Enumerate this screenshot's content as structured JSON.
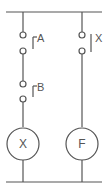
{
  "diagram": {
    "type": "ladder-logic-relay-circuit",
    "top_cutoff_text": "",
    "rungs": [
      {
        "contacts": [
          {
            "label": "A",
            "type": "normally-open"
          },
          {
            "label": "B",
            "type": "normally-open"
          }
        ],
        "coil": {
          "label": "X"
        }
      },
      {
        "contacts": [
          {
            "label": "X",
            "type": "normally-closed"
          }
        ],
        "coil": {
          "label": "F"
        }
      }
    ]
  }
}
